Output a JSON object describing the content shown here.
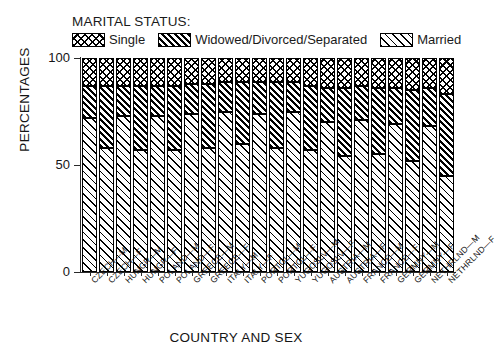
{
  "legend": {
    "title": "MARITAL STATUS:",
    "entries": [
      {
        "label": "Single",
        "pattern": "crosshatch"
      },
      {
        "label": "Widowed/Divorced/Separated",
        "pattern": "dense-diagonal"
      },
      {
        "label": "Married",
        "pattern": "sparse-diagonal"
      }
    ]
  },
  "chart_data": {
    "type": "bar",
    "stacked": true,
    "title": "",
    "xlabel": "COUNTRY AND SEX",
    "ylabel": "PERCENTAGES",
    "ylim": [
      0,
      100
    ],
    "yticks": [
      0,
      50,
      100
    ],
    "ytick_labels": [
      "0",
      "50",
      "100"
    ],
    "grid": false,
    "legend_position": "top",
    "categories": [
      "CZECH—M",
      "CZECH—F",
      "HUNGR—M",
      "HUNGR—F",
      "POLAND—M",
      "POLAND—F",
      "GREECE—M",
      "GREECE—F",
      "ITALY—M",
      "ITALY—F",
      "PORTGL—M",
      "PORTGL—F",
      "YUGOSLV—M",
      "YUGOSLV—F",
      "AUSTRIA—M",
      "AUSTRIA—F",
      "FRANCE—M",
      "FRANCE—F",
      "GERMNY—M",
      "GERMNY—F",
      "NETHRLND—M",
      "NETHRLND—F"
    ],
    "series": [
      {
        "name": "Married",
        "values": [
          72,
          58,
          73,
          57,
          73,
          57,
          74,
          58,
          75,
          60,
          74,
          58,
          75,
          57,
          70,
          54,
          71,
          55,
          69,
          52,
          68,
          45
        ]
      },
      {
        "name": "Widowed/Divorced/Separated",
        "values": [
          15,
          29,
          14,
          30,
          14,
          30,
          14,
          30,
          14,
          29,
          15,
          31,
          14,
          30,
          16,
          32,
          16,
          31,
          17,
          33,
          18,
          38
        ]
      },
      {
        "name": "Single",
        "values": [
          13,
          13,
          13,
          13,
          13,
          13,
          12,
          12,
          11,
          11,
          11,
          11,
          11,
          13,
          14,
          14,
          13,
          14,
          14,
          15,
          14,
          17
        ]
      }
    ]
  }
}
